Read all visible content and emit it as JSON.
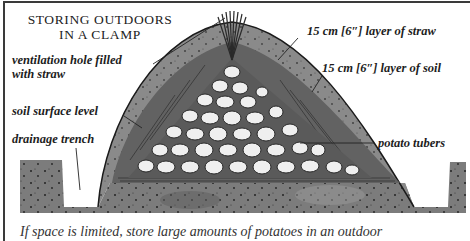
{
  "figure": {
    "title_line1": "STORING OUTDOORS",
    "title_line2": "IN A CLAMP",
    "labels": {
      "ventilation_line1": "ventilation hole filled",
      "ventilation_line2": "with straw",
      "soil_surface": "soil surface level",
      "drainage": "drainage trench",
      "straw_layer": "15 cm [6″] layer of straw",
      "soil_layer": "15 cm [6″] layer of soil",
      "tubers": "potato tubers"
    },
    "caption": "If space is limited, store large amounts of potatoes in an outdoor"
  },
  "colors": {
    "soil_dark": "#6e6e6e",
    "soil_mid": "#8a8a8a",
    "straw": "#5a5a5a",
    "potato": "#ececec",
    "ink": "#1d1d1d"
  }
}
